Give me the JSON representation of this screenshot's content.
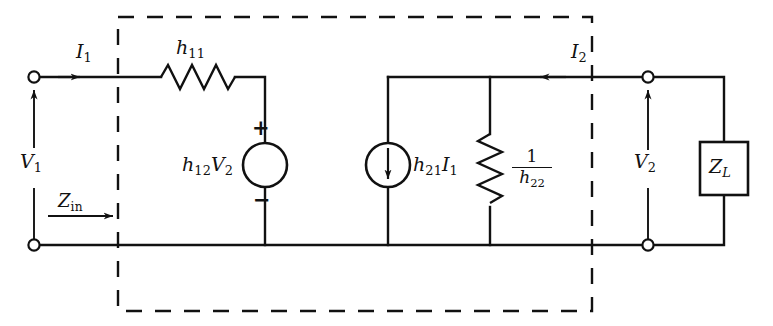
{
  "figure": {
    "type": "circuit-schematic",
    "line_color": "#111111",
    "background_color": "#ffffff"
  },
  "labels": {
    "input_voltage": "V",
    "input_voltage_sub": "1",
    "input_current": "I",
    "input_current_sub": "1",
    "input_impedance": "Z",
    "input_impedance_sub": "in",
    "series_resistor": "h",
    "series_resistor_sub": "11",
    "dependent_voltage_source": "h",
    "dependent_voltage_source_sub": "12",
    "dependent_voltage_source_factor": "V",
    "dependent_voltage_source_factor_sub": "2",
    "plus_sign": "+",
    "minus_sign": "−",
    "dependent_current_source": "h",
    "dependent_current_source_sub": "21",
    "dependent_current_source_factor": "I",
    "dependent_current_source_factor_sub": "1",
    "shunt_resistor_numerator": "1",
    "shunt_resistor_denominator": "h",
    "shunt_resistor_denominator_sub": "22",
    "output_current": "I",
    "output_current_sub": "2",
    "output_voltage": "V",
    "output_voltage_sub": "2",
    "load_impedance": "Z",
    "load_impedance_sub": "L"
  }
}
